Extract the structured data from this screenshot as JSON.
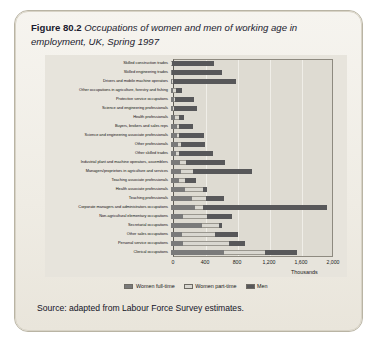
{
  "figure": {
    "label": "Figure 80.2",
    "caption": "Occupations of women and men of working age in employment, UK, Spring 1997",
    "source": "Source: adapted from Labour Force Survey estimates."
  },
  "colors": {
    "women_full_time": "#7a7a7a",
    "women_part_time": "#d9d7d0",
    "men": "#58585a",
    "card_background": "#f1eee7",
    "plot_background": "#dedbd2"
  },
  "chart_data": {
    "type": "bar",
    "orientation": "horizontal",
    "stacked": true,
    "title": "Occupations of women and men of working age in employment, UK, Spring 1997",
    "xlabel": "Thousands",
    "ylabel": "",
    "xlim": [
      0,
      2000
    ],
    "xticks": [
      0,
      400,
      800,
      1200,
      1600,
      2000
    ],
    "xticklabels": [
      "0",
      "400",
      "800",
      "1,200",
      "1,600",
      "2,000"
    ],
    "grid": true,
    "legend_position": "bottom",
    "categories": [
      "Skilled construction trades",
      "Skilled engineering trades",
      "Drivers and mobile machine operators",
      "Other occupations in agriculture, forestry and fishing",
      "Protective service occupations",
      "Science and engineering professionals",
      "Health professionals",
      "Buyers, brokers and sales reps",
      "Science and engineering associate professionals",
      "Other professionals",
      "Other skilled trades",
      "Industrial plant and machine operators, assemblers",
      "Managers/proprietors in agriculture and services",
      "Teaching associate professionals",
      "Health associate professionals",
      "Teaching professionals",
      "Corporate managers and administrators occupations",
      "Non-agricultural elementary occupations",
      "Secretarial occupations",
      "Other sales occupations",
      "Personal service occupations",
      "Clerical occupations"
    ],
    "series": [
      {
        "name": "Women full-time",
        "color": "#7a7a7a",
        "values": [
          5,
          10,
          12,
          20,
          35,
          30,
          55,
          70,
          75,
          85,
          60,
          115,
          130,
          95,
          170,
          260,
          300,
          145,
          390,
          135,
          150,
          660
        ]
      },
      {
        "name": "Women part-time",
        "color": "#d9d7d0",
        "values": [
          3,
          5,
          8,
          45,
          20,
          10,
          45,
          35,
          30,
          40,
          45,
          75,
          150,
          80,
          230,
          175,
          95,
          310,
          215,
          420,
          580,
          520
        ]
      },
      {
        "name": "Men",
        "color": "#58585a",
        "values": [
          530,
          620,
          790,
          70,
          230,
          290,
          60,
          165,
          310,
          305,
          425,
          485,
          735,
          135,
          55,
          225,
          1555,
          310,
          30,
          280,
          200,
          395
        ]
      }
    ]
  },
  "legend": {
    "items": [
      {
        "label": "Women full-time",
        "key": "wft"
      },
      {
        "label": "Women part-time",
        "key": "wpt"
      },
      {
        "label": "Men",
        "key": "men"
      }
    ]
  }
}
